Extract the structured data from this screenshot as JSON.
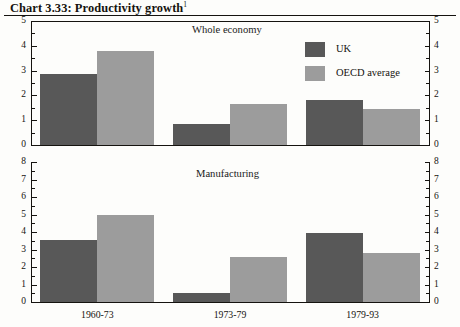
{
  "title": {
    "text": "Chart 3.33: Productivity growth",
    "footnote_marker": "1"
  },
  "legend": {
    "items": [
      {
        "label": "UK",
        "color": "#585858"
      },
      {
        "label": "OECD average",
        "color": "#9c9c9c"
      }
    ]
  },
  "axis": {
    "categories": [
      "1960-73",
      "1973-79",
      "1979-93"
    ],
    "top_ticks": [
      "0",
      "1",
      "2",
      "3",
      "4",
      "5"
    ],
    "bottom_ticks": [
      "0",
      "1",
      "2",
      "3",
      "4",
      "5",
      "6",
      "7",
      "8"
    ]
  },
  "panels": {
    "top": {
      "subtitle": "Whole economy"
    },
    "bottom": {
      "subtitle": "Manufacturing"
    }
  },
  "chart_data": [
    {
      "type": "bar",
      "title": "Whole economy",
      "categories": [
        "1960-73",
        "1973-79",
        "1979-93"
      ],
      "series": [
        {
          "name": "UK",
          "color": "#585858",
          "values": [
            2.85,
            0.85,
            1.8
          ]
        },
        {
          "name": "OECD average",
          "color": "#9c9c9c",
          "values": [
            3.8,
            1.65,
            1.45
          ]
        }
      ],
      "xlabel": "",
      "ylabel": "",
      "ylim": [
        0,
        5
      ],
      "ytick_step": 1,
      "yminor_step": 0.5,
      "grid": false,
      "legend_position": "top-right",
      "dual_y_axis": true
    },
    {
      "type": "bar",
      "title": "Manufacturing",
      "categories": [
        "1960-73",
        "1973-79",
        "1979-93"
      ],
      "series": [
        {
          "name": "UK",
          "color": "#585858",
          "values": [
            3.55,
            0.5,
            3.95
          ]
        },
        {
          "name": "OECD average",
          "color": "#9c9c9c",
          "values": [
            4.95,
            2.55,
            2.8
          ]
        }
      ],
      "xlabel": "",
      "ylabel": "",
      "ylim": [
        0,
        8
      ],
      "ytick_step": 1,
      "yminor_step": 0.5,
      "grid": false,
      "legend_position": "none",
      "dual_y_axis": true
    }
  ]
}
